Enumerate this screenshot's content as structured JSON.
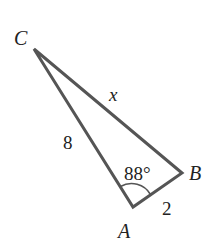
{
  "diagram": {
    "type": "triangle",
    "stroke_color": "#555555",
    "text_color": "#222222",
    "vertices": [
      {
        "id": "C",
        "label": "C",
        "x": 34,
        "y": 49
      },
      {
        "id": "A",
        "label": "A",
        "x": 133,
        "y": 207
      },
      {
        "id": "B",
        "label": "B",
        "x": 182,
        "y": 173
      }
    ],
    "sides": [
      {
        "from": "C",
        "to": "A",
        "label": "8"
      },
      {
        "from": "A",
        "to": "B",
        "label": "2"
      },
      {
        "from": "C",
        "to": "B",
        "label": "x"
      }
    ],
    "angles": [
      {
        "at": "A",
        "label": "88°"
      }
    ]
  }
}
